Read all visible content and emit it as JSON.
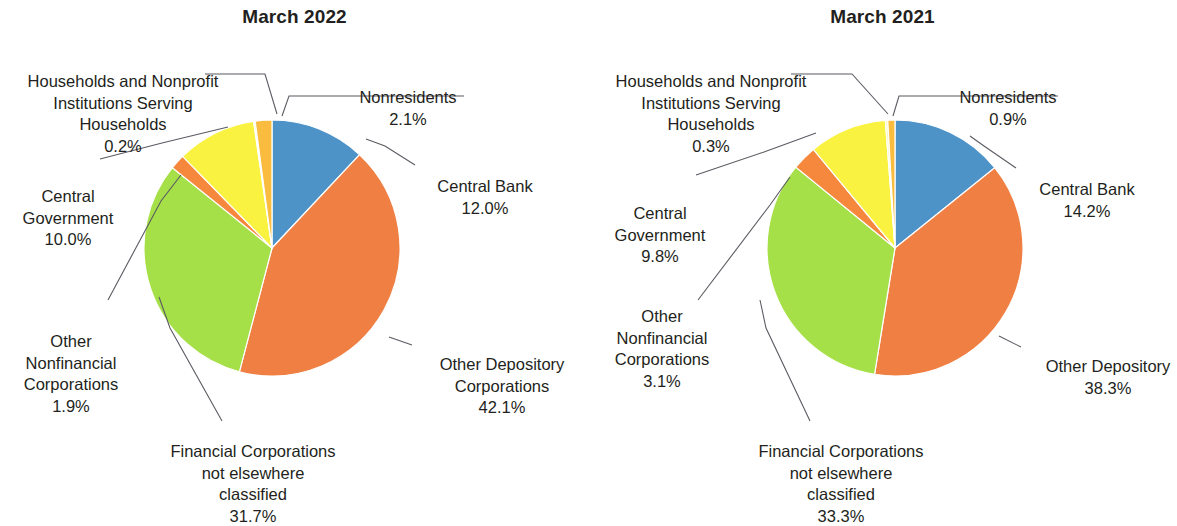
{
  "chart_data": [
    {
      "type": "pie",
      "title": "March 2022",
      "labels": [
        "Central Bank",
        "Other Depository Corporations",
        "Financial Corporations not elsewhere classified",
        "Other Nonfinancial Corporations",
        "Central Government",
        "Households and Nonprofit Institutions Serving Households",
        "Nonresidents"
      ],
      "values": [
        12.0,
        42.1,
        31.7,
        1.9,
        10.0,
        0.2,
        2.1
      ],
      "value_labels": [
        "12.0%",
        "42.1%",
        "31.7%",
        "1.9%",
        "10.0%",
        "0.2%",
        "2.1%"
      ],
      "colors": [
        "#4d93c8",
        "#f07f43",
        "#a6e048",
        "#f5883c",
        "#faf240",
        "#fbf6b0",
        "#f9bc3f"
      ],
      "legend": "none",
      "grid": false
    },
    {
      "type": "pie",
      "title": "March 2021",
      "labels": [
        "Central Bank",
        "Other Depository",
        "Financial Corporations not elsewhere classified",
        "Other Nonfinancial Corporations",
        "Central Government",
        "Households and Nonprofit Institutions Serving Households",
        "Nonresidents"
      ],
      "values": [
        14.2,
        38.3,
        33.3,
        3.1,
        9.8,
        0.3,
        0.9
      ],
      "value_labels": [
        "14.2%",
        "38.3%",
        "33.3%",
        "3.1%",
        "9.8%",
        "0.3%",
        "0.9%"
      ],
      "colors": [
        "#4d93c8",
        "#f07f43",
        "#a6e048",
        "#f5883c",
        "#faf240",
        "#fbf6b0",
        "#f9bc3f"
      ],
      "legend": "none",
      "grid": false
    }
  ],
  "left": {
    "title": "March 2022",
    "labels": {
      "households": "Households and Nonprofit\nInstitutions Serving\nHouseholds",
      "households_pct": "0.2%",
      "nonresidents": "Nonresidents",
      "nonresidents_pct": "2.1%",
      "central_bank": "Central Bank",
      "central_bank_pct": "12.0%",
      "central_government": "Central\nGovernment",
      "central_government_pct": "10.0%",
      "other_nonfinancial": "Other\nNonfinancial\nCorporations",
      "other_nonfinancial_pct": "1.9%",
      "financial_nec": "Financial Corporations\nnot elsewhere\nclassified",
      "financial_nec_pct": "31.7%",
      "other_depository": "Other Depository\nCorporations",
      "other_depository_pct": "42.1%"
    }
  },
  "right": {
    "title": "March 2021",
    "labels": {
      "households": "Households and Nonprofit\nInstitutions Serving\nHouseholds",
      "households_pct": "0.3%",
      "nonresidents": "Nonresidents",
      "nonresidents_pct": "0.9%",
      "central_bank": "Central Bank",
      "central_bank_pct": "14.2%",
      "central_government": "Central\nGovernment",
      "central_government_pct": "9.8%",
      "other_nonfinancial": "Other\nNonfinancial\nCorporations",
      "other_nonfinancial_pct": "3.1%",
      "financial_nec": "Financial Corporations\nnot elsewhere\nclassified",
      "financial_nec_pct": "33.3%",
      "other_depository": "Other Depository",
      "other_depository_pct": "38.3%"
    }
  }
}
